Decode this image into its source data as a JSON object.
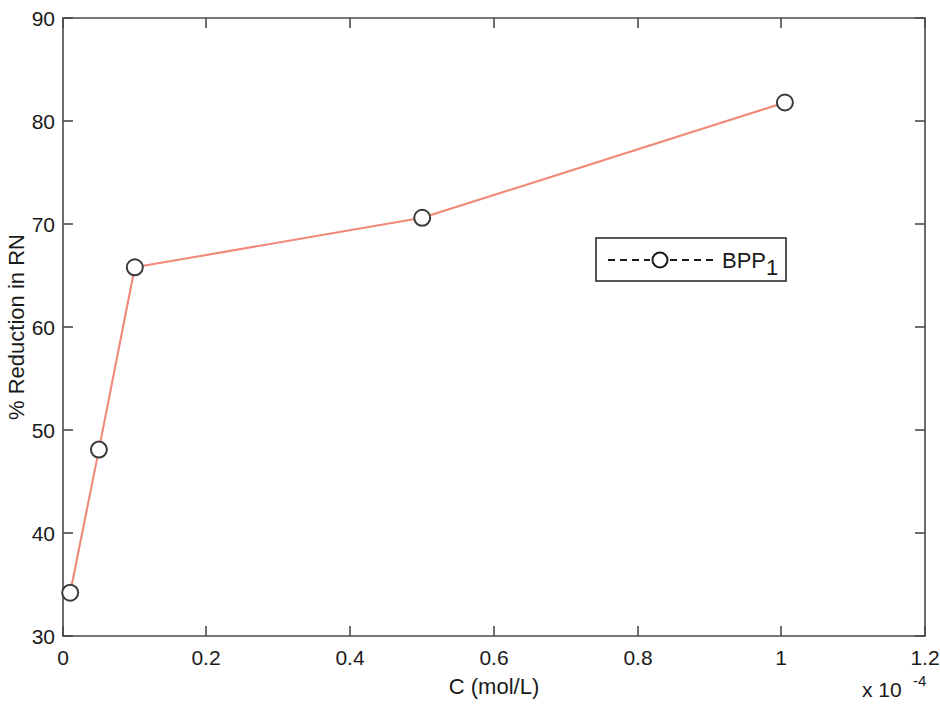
{
  "chart_data": {
    "type": "line",
    "title": "",
    "subtitle": "",
    "xlabel": "C (mol/L)",
    "ylabel": "% Reduction in RN",
    "x_exponent_label": "x 10",
    "x_exponent_value": "-4",
    "xlim": [
      0,
      1.2
    ],
    "ylim": [
      30,
      90
    ],
    "xticks": [
      "0",
      "0.2",
      "0.4",
      "0.6",
      "0.8",
      "1",
      "1.2"
    ],
    "xtick_values": [
      0,
      0.2,
      0.4,
      0.6,
      0.8,
      1.0,
      1.2
    ],
    "yticks": [
      "30",
      "40",
      "50",
      "60",
      "70",
      "80",
      "90"
    ],
    "ytick_values": [
      30,
      40,
      50,
      60,
      70,
      80,
      90
    ],
    "grid": false,
    "legend_position": "center-right",
    "series": [
      {
        "name": "BPP",
        "name_subscript": "1",
        "legend_label": "BPP",
        "line_color": "#F08978",
        "marker_color": "#3a3a3a",
        "marker": "circle",
        "linestyle": "solid",
        "x": [
          0.01,
          0.05,
          0.1,
          0.5,
          1.005
        ],
        "values": [
          34.2,
          48.1,
          65.8,
          70.6,
          81.8
        ]
      }
    ],
    "legend_entries": [
      {
        "label": "BPP",
        "subscript": "1",
        "linestyle": "dashed",
        "marker": "O"
      }
    ]
  },
  "colors": {
    "line": "#F08978",
    "axis": "#4a4a4a",
    "text": "#1a1a1a",
    "background": "#ffffff"
  }
}
